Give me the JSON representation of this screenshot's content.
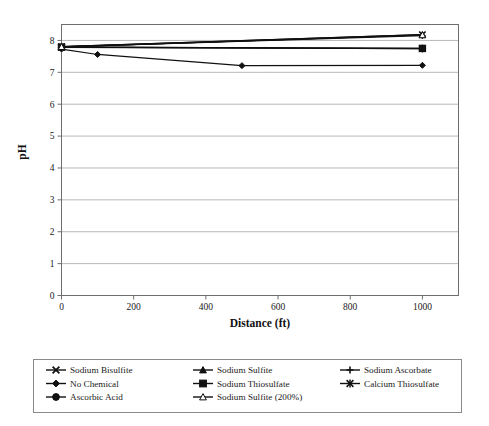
{
  "chart_data": {
    "type": "line",
    "title": "",
    "xlabel": "Distance (ft)",
    "ylabel": "pH",
    "xlim": [
      0,
      1100
    ],
    "ylim": [
      0,
      8.5
    ],
    "grid": "horizontal",
    "legend_position": "bottom",
    "x_ticks": [
      0,
      200,
      400,
      600,
      800,
      1000
    ],
    "x_tick_labels": [
      "0",
      "200",
      "400",
      "600",
      "800",
      "1000"
    ],
    "y_ticks": [
      0,
      1,
      2,
      3,
      4,
      5,
      6,
      7,
      8
    ],
    "y_tick_labels": [
      "0",
      "1",
      "2",
      "3",
      "4",
      "5",
      "6",
      "7",
      "8"
    ],
    "series": [
      {
        "name": "Sodium Bisulfite",
        "marker": "x-cross",
        "fill": "solid",
        "x": [
          0,
          1000
        ],
        "values": [
          7.8,
          8.18
        ]
      },
      {
        "name": "Sodium Sulfite",
        "marker": "triangle",
        "fill": "solid",
        "x": [
          0,
          1000
        ],
        "values": [
          7.8,
          8.18
        ]
      },
      {
        "name": "Sodium Ascorbate",
        "marker": "plus",
        "fill": "solid",
        "x": [
          0,
          1000
        ],
        "values": [
          7.8,
          8.15
        ]
      },
      {
        "name": "No Chemical",
        "marker": "diamond",
        "fill": "solid",
        "x": [
          0,
          100,
          500,
          1000
        ],
        "values": [
          7.73,
          7.56,
          7.21,
          7.22
        ]
      },
      {
        "name": "Sodium Thiosulfate",
        "marker": "square",
        "fill": "solid",
        "x": [
          0,
          1000
        ],
        "values": [
          7.79,
          7.75
        ]
      },
      {
        "name": "Calcium Thiosulfate",
        "marker": "asterisk",
        "fill": "solid",
        "x": [
          0,
          1000
        ],
        "values": [
          7.79,
          7.75
        ]
      },
      {
        "name": "Ascorbic Acid",
        "marker": "circle",
        "fill": "solid",
        "x": [
          0,
          1000
        ],
        "values": [
          7.79,
          7.74
        ]
      },
      {
        "name": "Sodium Sulfite (200%)",
        "marker": "triangle-open",
        "fill": "open",
        "x": [
          0,
          1000
        ],
        "values": [
          7.8,
          8.17
        ]
      }
    ]
  },
  "legend": {
    "rows": [
      [
        {
          "label": "Sodium Bisulfite",
          "marker": "x-cross"
        },
        {
          "label": "Sodium Sulfite",
          "marker": "triangle"
        },
        {
          "label": "Sodium Ascorbate",
          "marker": "plus"
        }
      ],
      [
        {
          "label": "No Chemical",
          "marker": "diamond"
        },
        {
          "label": "Sodium Thiosulfate",
          "marker": "square"
        },
        {
          "label": "Calcium Thiosulfate",
          "marker": "asterisk"
        }
      ],
      [
        {
          "label": "Ascorbic Acid",
          "marker": "circle"
        },
        {
          "label": "Sodium Sulfite (200%)",
          "marker": "triangle-open"
        }
      ]
    ]
  },
  "colors": {
    "series": "#111111",
    "grid": "#9a9a9a",
    "frame": "#6e6e6e",
    "background": "#ffffff",
    "text": "#1a1a1a"
  }
}
